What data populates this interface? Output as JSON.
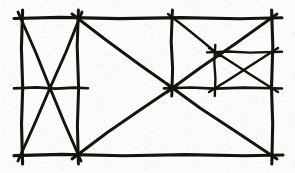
{
  "figure": {
    "medium": "ink line drawing",
    "ink_color": "#15130f",
    "paper_color": "#fbfbf9",
    "width": 295,
    "height": 173,
    "stroke_style": "rough hand-drawn, strokes overshoot past intersections"
  },
  "geometry": {
    "outer_frame": {
      "left": 22,
      "top": 18,
      "right": 272,
      "bottom": 155,
      "label": "outer-rectangle"
    },
    "vertical_dividers": [
      {
        "name": "divider-left",
        "x": 78,
        "y1": 18,
        "y2": 155
      },
      {
        "name": "divider-middle",
        "x": 172,
        "y1": 18,
        "y2": 88
      },
      {
        "name": "divider-nested",
        "x": 215,
        "y1": 52,
        "y2": 88
      }
    ],
    "horizontal_dividers": [
      {
        "name": "midline-left-cell",
        "y": 88,
        "x1": 22,
        "x2": 78
      },
      {
        "name": "midline-right-cell",
        "y": 88,
        "x1": 172,
        "x2": 272
      },
      {
        "name": "midline-nested-cell",
        "y": 52,
        "x1": 215,
        "x2": 272
      }
    ],
    "diagonals": [
      {
        "name": "left-cell-diagonal-down",
        "x1": 22,
        "y1": 18,
        "x2": 78,
        "y2": 155
      },
      {
        "name": "left-cell-diagonal-up",
        "x1": 78,
        "y1": 18,
        "x2": 22,
        "y2": 155
      },
      {
        "name": "middle-cell-diagonal-down",
        "x1": 78,
        "y1": 18,
        "x2": 172,
        "y2": 88
      },
      {
        "name": "middle-cell-diagonal-up",
        "x1": 78,
        "y1": 155,
        "x2": 172,
        "y2": 88
      },
      {
        "name": "right-cell-diagonal-down",
        "x1": 172,
        "y1": 88,
        "x2": 272,
        "y2": 155
      },
      {
        "name": "right-upper-diagonal-down",
        "x1": 172,
        "y1": 18,
        "x2": 215,
        "y2": 52
      },
      {
        "name": "right-upper-diagonal-up",
        "x1": 172,
        "y1": 88,
        "x2": 272,
        "y2": 18
      },
      {
        "name": "nested-cell-diagonal-down",
        "x1": 215,
        "y1": 52,
        "x2": 272,
        "y2": 88
      },
      {
        "name": "nested-cell-diagonal-up",
        "x1": 215,
        "y1": 88,
        "x2": 272,
        "y2": 52
      }
    ],
    "vertices": [
      {
        "name": "corner-top-left",
        "x": 22,
        "y": 18
      },
      {
        "name": "corner-top-right",
        "x": 272,
        "y": 18
      },
      {
        "name": "corner-bottom-left",
        "x": 22,
        "y": 155
      },
      {
        "name": "corner-bottom-right",
        "x": 272,
        "y": 155
      },
      {
        "name": "node-top-divider-left",
        "x": 78,
        "y": 18
      },
      {
        "name": "node-bottom-divider-left",
        "x": 78,
        "y": 155
      },
      {
        "name": "node-top-divider-middle",
        "x": 172,
        "y": 18
      },
      {
        "name": "node-left-cell-center",
        "x": 50,
        "y": 88
      },
      {
        "name": "node-left-midline-start",
        "x": 22,
        "y": 88
      },
      {
        "name": "node-left-midline-end",
        "x": 78,
        "y": 88
      },
      {
        "name": "node-central-hub",
        "x": 172,
        "y": 88
      },
      {
        "name": "node-nested-top-left",
        "x": 215,
        "y": 52
      },
      {
        "name": "node-nested-bottom-left",
        "x": 215,
        "y": 88
      },
      {
        "name": "node-nested-top-right",
        "x": 272,
        "y": 52
      },
      {
        "name": "node-nested-bottom-right",
        "x": 272,
        "y": 88
      }
    ]
  },
  "cells": [
    {
      "name": "cell-left",
      "contents": "rectangle with both diagonals forming an X plus a horizontal midline"
    },
    {
      "name": "cell-middle",
      "contents": "open region with two diagonals converging on the central hub"
    },
    {
      "name": "cell-right-lower",
      "contents": "large triangle formed by diagonal from central hub to bottom-right corner"
    },
    {
      "name": "cell-right-upper",
      "contents": "subdivided region containing a nested cell with an X"
    },
    {
      "name": "cell-nested",
      "contents": "small rectangle with both diagonals forming an X"
    }
  ]
}
